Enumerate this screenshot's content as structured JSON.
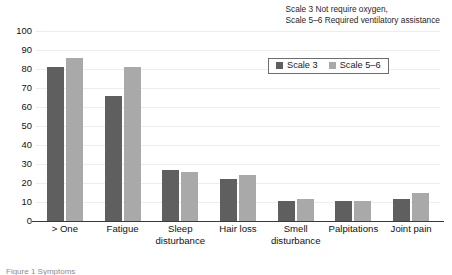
{
  "note": {
    "line1": "Scale 3 Not require oxygen,",
    "line2": "Scale 5–6 Required ventilatory assistance"
  },
  "legend": {
    "entries": [
      {
        "label": "Scale 3",
        "color": "#5f5f5f"
      },
      {
        "label": "Scale 5–6",
        "color": "#a9a9a9"
      }
    ]
  },
  "caption": {
    "text": "Figure 1 Symptoms"
  },
  "chart_data": {
    "type": "bar",
    "title": "",
    "subtitle": "",
    "xlabel": "",
    "ylabel": "",
    "ylim": [
      0,
      100
    ],
    "ytick_step": 10,
    "yticks": [
      "100",
      "90",
      "80",
      "70",
      "60",
      "50",
      "40",
      "30",
      "20",
      "10",
      "0"
    ],
    "grid": true,
    "legend_position": "upper right inside",
    "categories": [
      "> One",
      "Fatigue",
      "Sleep disturbance",
      "Hair loss",
      "Smell disturbance",
      "Palpitations",
      "Joint pain"
    ],
    "category_lines": [
      [
        "> One"
      ],
      [
        "Fatigue"
      ],
      [
        "Sleep",
        "disturbance"
      ],
      [
        "Hair loss"
      ],
      [
        "Smell",
        "disturbance"
      ],
      [
        "Palpitations"
      ],
      [
        "Joint pain"
      ]
    ],
    "series": [
      {
        "name": "Scale 3",
        "color": "#5f5f5f",
        "values": [
          81,
          66,
          27,
          22,
          10.5,
          10.5,
          11.5
        ]
      },
      {
        "name": "Scale 5–6",
        "color": "#a9a9a9",
        "values": [
          86,
          81,
          26,
          24,
          11.5,
          10.5,
          14.5
        ]
      }
    ],
    "annotations": [
      "Scale 3 Not require oxygen,",
      "Scale 5–6 Required ventilatory assistance"
    ]
  }
}
